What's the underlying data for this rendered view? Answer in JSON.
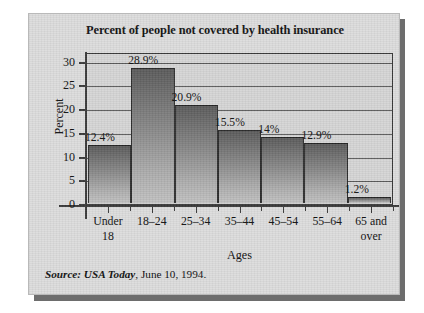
{
  "figure": {
    "title": "Percent of people not covered by health insurance",
    "source_prefix": "Source: USA Today",
    "source_rest": ", June 10, 1994."
  },
  "chart_data": {
    "type": "bar",
    "title": "Percent of people not covered by health insurance",
    "xlabel": "Ages",
    "ylabel": "Percent",
    "categories": [
      "Under 18",
      "18–24",
      "25–34",
      "35–44",
      "45–54",
      "55–64",
      "65 and over"
    ],
    "category_lines": [
      {
        "line1": "Under",
        "line2": "18"
      },
      {
        "line1": "18–24",
        "line2": ""
      },
      {
        "line1": "25–34",
        "line2": ""
      },
      {
        "line1": "35–44",
        "line2": ""
      },
      {
        "line1": "45–54",
        "line2": ""
      },
      {
        "line1": "55–64",
        "line2": ""
      },
      {
        "line1": "65 and",
        "line2": "over"
      }
    ],
    "values": [
      12.4,
      28.9,
      20.9,
      15.5,
      14,
      12.9,
      1.2
    ],
    "data_labels": [
      "12.4%",
      "28.9%",
      "20.9%",
      "15.5%",
      "14%",
      "12.9%",
      "1.2%"
    ],
    "ylim": [
      0,
      32
    ],
    "yticks": [
      0,
      5,
      10,
      15,
      20,
      25,
      30
    ],
    "ytick_labels": [
      "0",
      "5",
      "10",
      "15",
      "20",
      "25",
      "30"
    ],
    "grid": true,
    "legend": null,
    "bar_gap": 0,
    "colors": {
      "bar_top": "#5b5b5b",
      "bar_bottom": "#c2c2c2",
      "panel_background": "#dddddd",
      "plot_background": "#d6d6d6",
      "axis": "#3a3a3a",
      "text": "#101010",
      "shadow": "#6d6d6d"
    }
  }
}
